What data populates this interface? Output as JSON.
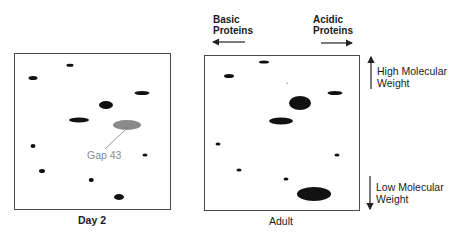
{
  "header": {
    "basic_label_line1": "Basic",
    "basic_label_line2": "Proteins",
    "acidic_label_line1": "Acidic",
    "acidic_label_line2": "Proteins"
  },
  "axis": {
    "high_line1": "High Molecular",
    "high_line2": "Weight",
    "low_line1": "Low Molecular",
    "low_line2": "Weight"
  },
  "panels": [
    {
      "caption": "Day 2",
      "box": {
        "x": 14,
        "y": 53,
        "w": 157,
        "h": 157
      },
      "spots": [
        {
          "x": 33,
          "y": 78,
          "w": 9,
          "h": 4,
          "color": "#111111"
        },
        {
          "x": 70,
          "y": 65,
          "w": 7,
          "h": 2.5,
          "color": "#111111"
        },
        {
          "x": 142,
          "y": 93,
          "w": 15,
          "h": 4,
          "color": "#111111"
        },
        {
          "x": 106,
          "y": 105,
          "w": 14,
          "h": 8,
          "color": "#111111"
        },
        {
          "x": 79,
          "y": 120,
          "w": 20,
          "h": 5,
          "color": "#111111"
        },
        {
          "x": 127,
          "y": 125,
          "w": 28,
          "h": 10,
          "color": "#8a8a8a"
        },
        {
          "x": 33,
          "y": 146,
          "w": 5,
          "h": 4,
          "color": "#111111"
        },
        {
          "x": 145,
          "y": 155,
          "w": 5,
          "h": 3,
          "color": "#111111"
        },
        {
          "x": 42,
          "y": 171,
          "w": 6,
          "h": 4,
          "color": "#111111"
        },
        {
          "x": 91,
          "y": 180,
          "w": 4.5,
          "h": 4,
          "color": "#111111"
        },
        {
          "x": 119,
          "y": 197,
          "w": 10,
          "h": 6,
          "color": "#111111"
        }
      ],
      "annotation": {
        "text": "Gap 43",
        "x": 80,
        "y": 150,
        "color": "#8a8a8a"
      }
    },
    {
      "caption": "Adult",
      "box": {
        "x": 204,
        "y": 55,
        "w": 156,
        "h": 156
      },
      "spots": [
        {
          "x": 264,
          "y": 62,
          "w": 10,
          "h": 3,
          "color": "#111111"
        },
        {
          "x": 229,
          "y": 76,
          "w": 10,
          "h": 4,
          "color": "#111111"
        },
        {
          "x": 287,
          "y": 83,
          "w": 1.5,
          "h": 1.5,
          "color": "#bbbbbb"
        },
        {
          "x": 335,
          "y": 93,
          "w": 15,
          "h": 4,
          "color": "#111111"
        },
        {
          "x": 300,
          "y": 103,
          "w": 22,
          "h": 14,
          "color": "#111111"
        },
        {
          "x": 281,
          "y": 121,
          "w": 24,
          "h": 7,
          "color": "#111111"
        },
        {
          "x": 218,
          "y": 144,
          "w": 5,
          "h": 3,
          "color": "#111111"
        },
        {
          "x": 337,
          "y": 155,
          "w": 5,
          "h": 3,
          "color": "#111111"
        },
        {
          "x": 239,
          "y": 170,
          "w": 5,
          "h": 3,
          "color": "#111111"
        },
        {
          "x": 286,
          "y": 179,
          "w": 5,
          "h": 3,
          "color": "#111111"
        },
        {
          "x": 314,
          "y": 194,
          "w": 34,
          "h": 14,
          "color": "#111111"
        }
      ]
    }
  ]
}
